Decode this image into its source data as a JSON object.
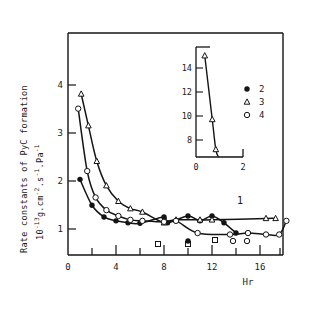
{
  "axes": {
    "ylabel_line1": "Rate constants of PyC formation",
    "ylabel_line2_prefix": "10",
    "ylabel_line2_exp": "-13",
    "ylabel_line2_mid": "g.cm",
    "ylabel_line2_exp2": "-2",
    "ylabel_line2_mid2": ".s",
    "ylabel_line2_exp3": "-1",
    "ylabel_line2_mid3": ".Pa",
    "ylabel_line2_exp4": "-1",
    "xlabel": "Hr",
    "x_ticks": [
      "0",
      "4",
      "8",
      "12",
      "16"
    ],
    "y_ticks": [
      "1",
      "2",
      "3",
      "4"
    ],
    "annotation_1": "1"
  },
  "inset": {
    "y_ticks": [
      "8",
      "10",
      "12",
      "14"
    ],
    "x_ticks": [
      "0",
      "2"
    ],
    "legend": [
      {
        "marker": "filled-circle",
        "label": "2"
      },
      {
        "marker": "open-triangle",
        "label": "3"
      },
      {
        "marker": "open-circle",
        "label": "4"
      }
    ]
  },
  "chart_data": {
    "type": "line",
    "title": "",
    "xlabel": "Hr",
    "ylabel": "Rate constants of PyC formation 10-13 g.cm-2.s-1.Pa-1",
    "xlim": [
      0,
      18.5
    ],
    "ylim": [
      0,
      4.55
    ],
    "x_ticks_major": [
      0,
      4,
      8,
      12,
      16
    ],
    "x_ticks_minor": [
      2,
      6,
      10,
      14,
      18
    ],
    "y_ticks_major": [
      1,
      2,
      3,
      4
    ],
    "grid": false,
    "legend_position": "inset-right",
    "annotations": [
      {
        "text": "1",
        "x": 15.0,
        "y": 1.05
      }
    ],
    "series": [
      {
        "name": "2",
        "marker": "filled-circle",
        "points": [
          {
            "x": 1.0,
            "y": 1.55
          },
          {
            "x": 2.0,
            "y": 1.02
          },
          {
            "x": 3.0,
            "y": 0.78
          },
          {
            "x": 4.0,
            "y": 0.7
          },
          {
            "x": 5.0,
            "y": 0.66
          },
          {
            "x": 6.0,
            "y": 0.65
          },
          {
            "x": 8.0,
            "y": 0.78
          },
          {
            "x": 8.3,
            "y": 0.66
          },
          {
            "x": 10.0,
            "y": 0.8
          },
          {
            "x": 11.0,
            "y": 0.7
          },
          {
            "x": 12.0,
            "y": 0.8
          },
          {
            "x": 13.0,
            "y": 0.66
          },
          {
            "x": 14.0,
            "y": 0.45
          }
        ]
      },
      {
        "name": "3",
        "marker": "open-triangle",
        "points": [
          {
            "x": 1.1,
            "y": 3.3
          },
          {
            "x": 1.7,
            "y": 2.65
          },
          {
            "x": 2.4,
            "y": 1.92
          },
          {
            "x": 3.2,
            "y": 1.42
          },
          {
            "x": 4.2,
            "y": 1.1
          },
          {
            "x": 5.2,
            "y": 0.95
          },
          {
            "x": 6.2,
            "y": 0.88
          },
          {
            "x": 8.0,
            "y": 0.66
          },
          {
            "x": 9.0,
            "y": 0.72
          },
          {
            "x": 11.0,
            "y": 0.72
          },
          {
            "x": 12.0,
            "y": 0.72
          },
          {
            "x": 16.5,
            "y": 0.75
          },
          {
            "x": 17.3,
            "y": 0.75
          }
        ]
      },
      {
        "name": "4",
        "marker": "open-circle",
        "points": [
          {
            "x": 0.85,
            "y": 3.0
          },
          {
            "x": 1.6,
            "y": 1.72
          },
          {
            "x": 2.3,
            "y": 1.18
          },
          {
            "x": 3.2,
            "y": 0.92
          },
          {
            "x": 4.2,
            "y": 0.8
          },
          {
            "x": 5.2,
            "y": 0.72
          },
          {
            "x": 6.2,
            "y": 0.7
          },
          {
            "x": 8.0,
            "y": 0.68
          },
          {
            "x": 9.0,
            "y": 0.7
          },
          {
            "x": 10.8,
            "y": 0.45
          },
          {
            "x": 13.5,
            "y": 0.42
          },
          {
            "x": 15.0,
            "y": 0.45
          },
          {
            "x": 16.5,
            "y": 0.42
          },
          {
            "x": 17.6,
            "y": 0.42
          },
          {
            "x": 18.2,
            "y": 0.7
          }
        ]
      }
    ],
    "inset": {
      "type": "line",
      "xlim": [
        0,
        2.35
      ],
      "ylim": [
        7.0,
        15.8
      ],
      "x_ticks": [
        0,
        2
      ],
      "y_ticks": [
        8,
        10,
        12,
        14
      ],
      "series": [
        {
          "name": "3",
          "marker": "open-triangle",
          "points": [
            {
              "x": 0.42,
              "y": 15.1
            },
            {
              "x": 0.78,
              "y": 10.0
            },
            {
              "x": 0.95,
              "y": 7.6
            }
          ]
        }
      ]
    }
  }
}
